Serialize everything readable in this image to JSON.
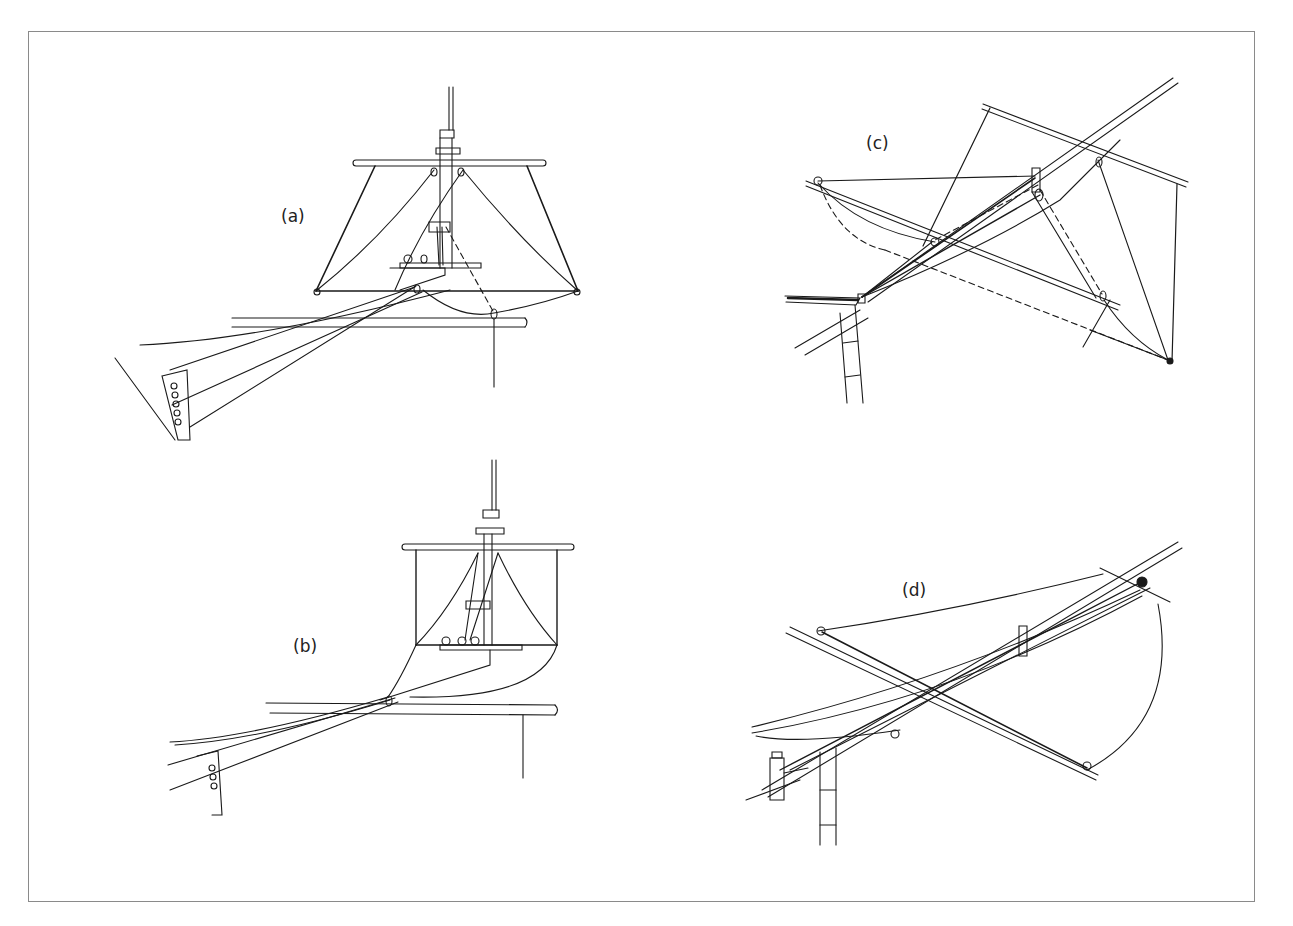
{
  "figure": {
    "panels": [
      {
        "id": "a",
        "label": "(a)",
        "description": "Square sail set on yard and boom from mast, viewed from ahead"
      },
      {
        "id": "b",
        "label": "(b)",
        "description": "Sail partially furled toward mast with boom"
      },
      {
        "id": "c",
        "label": "(c)",
        "description": "Yards canted, sail rigging with dashed hidden lines"
      },
      {
        "id": "d",
        "label": "(d)",
        "description": "Yard and boom crossed, sail set obliquely"
      }
    ],
    "colors": {
      "stroke": "#1a1a1a",
      "frame": "#8a8a8a",
      "background": "#ffffff"
    }
  }
}
